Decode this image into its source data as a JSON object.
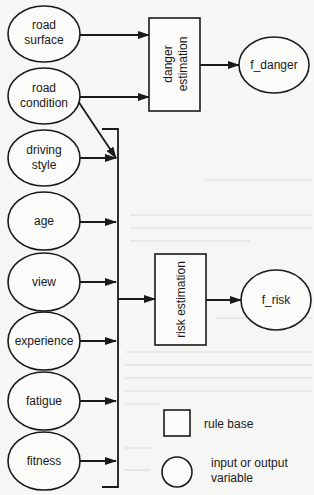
{
  "diagram": {
    "inputs": [
      {
        "id": "road_surface",
        "lines": [
          "road",
          "surface"
        ]
      },
      {
        "id": "road_condition",
        "lines": [
          "road",
          "condition"
        ]
      },
      {
        "id": "driving_style",
        "lines": [
          "driving",
          "style"
        ]
      },
      {
        "id": "age",
        "lines": [
          "age"
        ]
      },
      {
        "id": "view",
        "lines": [
          "view"
        ]
      },
      {
        "id": "experience",
        "lines": [
          "experience"
        ]
      },
      {
        "id": "fatigue",
        "lines": [
          "fatigue"
        ]
      },
      {
        "id": "fitness",
        "lines": [
          "fitness"
        ]
      }
    ],
    "rule_bases": [
      {
        "id": "danger_estimation",
        "lines": [
          "danger",
          "estimation"
        ],
        "inputs": [
          "road_surface",
          "road_condition"
        ],
        "output": "f_danger"
      },
      {
        "id": "risk_estimation",
        "lines": [
          "risk estimation"
        ],
        "inputs": [
          "road_condition",
          "driving_style",
          "age",
          "view",
          "experience",
          "fatigue",
          "fitness"
        ],
        "output": "f_risk"
      }
    ],
    "outputs": [
      {
        "id": "f_danger",
        "label": "f_danger"
      },
      {
        "id": "f_risk",
        "label": "f_risk"
      }
    ],
    "legend": {
      "rule_base": "rule base",
      "variable_line1": "input or output",
      "variable_line2": "variable"
    },
    "colors": {
      "stroke": "#1a1a1a",
      "background": "#f6f6f4"
    }
  }
}
